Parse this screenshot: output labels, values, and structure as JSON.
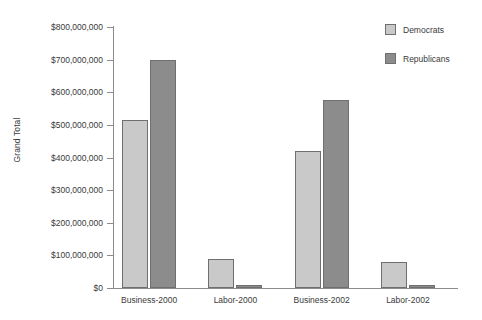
{
  "chart_data": {
    "type": "bar",
    "title": "",
    "xlabel": "",
    "ylabel": "Grand Total",
    "categories": [
      "Business-2000",
      "Labor-2000",
      "Business-2002",
      "Labor-2002"
    ],
    "series": [
      {
        "name": "Democrats",
        "color": "#c9c9c9",
        "values": [
          515000000,
          88000000,
          420000000,
          80000000
        ]
      },
      {
        "name": "Republicans",
        "color": "#8c8c8c",
        "values": [
          700000000,
          8000000,
          575000000,
          10000000
        ]
      }
    ],
    "ylim": [
      0,
      800000000
    ],
    "ytick_values": [
      0,
      100000000,
      200000000,
      300000000,
      400000000,
      500000000,
      600000000,
      700000000,
      800000000
    ],
    "ytick_labels": [
      "$0",
      "$100,000,000",
      "$200,000,000",
      "$300,000,000",
      "$400,000,000",
      "$500,000,000",
      "$600,000,000",
      "$700,000,000",
      "$800,000,000"
    ],
    "grid": false,
    "legend_position": "top-right"
  },
  "axis": {
    "y_title": "Grand Total"
  },
  "legend": {
    "entries": [
      {
        "label": "Democrats"
      },
      {
        "label": "Republicans"
      }
    ]
  }
}
